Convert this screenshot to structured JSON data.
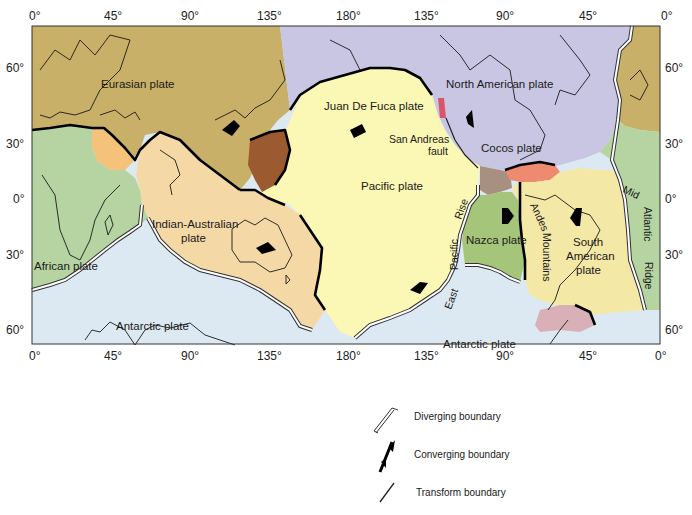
{
  "map": {
    "title": "Tectonic plates of the world",
    "top_axis_ticks": [
      "0°",
      "45°",
      "90°",
      "135°",
      "180°",
      "135°",
      "90°",
      "45°",
      "0°"
    ],
    "bottom_axis_ticks": [
      "0°",
      "45°",
      "90°",
      "135°",
      "180°",
      "135°",
      "90°",
      "45°",
      "0°"
    ],
    "left_axis_ticks": [
      "60°",
      "30°",
      "0°",
      "30°",
      "60°"
    ],
    "right_axis_ticks": [
      "60°",
      "30°",
      "0°",
      "30°",
      "60°"
    ],
    "plates": [
      {
        "name": "Eurasian plate",
        "color": "#c8b068"
      },
      {
        "name": "North American plate",
        "color": "#c9c6e4"
      },
      {
        "name": "Juan De Fuca plate",
        "color": "#d9566a"
      },
      {
        "name": "Pacific plate",
        "color": "#fbf7b4"
      },
      {
        "name": "Cocos plate",
        "color": "#ee8a70"
      },
      {
        "name": "Caribbean plate",
        "color": "#a89080"
      },
      {
        "name": "Nazca plate",
        "color": "#a5c57a"
      },
      {
        "name": "South American plate",
        "color": "#f4e8a6"
      },
      {
        "name": "African plate",
        "color": "#b5d4a2"
      },
      {
        "name": "Indian-Australian plate",
        "color": "#f4d9a6"
      },
      {
        "name": "Arabian plate",
        "color": "#f4c27a"
      },
      {
        "name": "Philippine plate",
        "color": "#9c5a30"
      },
      {
        "name": "Scotia plate",
        "color": "#d9b0b8"
      },
      {
        "name": "Antarctic plate",
        "color": "#dde9f2"
      }
    ],
    "labels": {
      "eurasian": "Eurasian plate",
      "north_american": "North American plate",
      "juan_de_fuca": "Juan De Fuca plate",
      "san_andreas_1": "San Andreas",
      "san_andreas_2": "fault",
      "pacific": "Pacific plate",
      "cocos": "Cocos plate",
      "indian_australian_1": "Indian-Australian",
      "indian_australian_2": "plate",
      "african": "African plate",
      "nazca": "Nazca plate",
      "south_american_1": "South",
      "south_american_2": "American",
      "south_american_3": "plate",
      "antarctic_west": "Antarctic plate",
      "antarctic_east": "Antarctic plate",
      "east_pacific_rise_1": "East",
      "east_pacific_rise_2": "Pacific",
      "east_pacific_rise_3": "Rise",
      "andes_1": "Andes",
      "andes_2": "Mountains",
      "mid_atlantic_1": "Mid",
      "mid_atlantic_2": "Atlantic",
      "mid_atlantic_3": "Ridge"
    }
  },
  "legend": {
    "items": [
      {
        "symbol": "diverging-boundary-symbol",
        "label": "Diverging boundary"
      },
      {
        "symbol": "converging-boundary-symbol",
        "label": "Converging boundary"
      },
      {
        "symbol": "transform-boundary-symbol",
        "label": "Transform boundary"
      }
    ]
  }
}
